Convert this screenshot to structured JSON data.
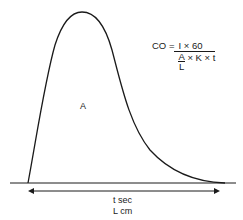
{
  "diagram": {
    "curve_label": "A",
    "formula": {
      "lhs": "CO",
      "equals": "=",
      "numerator": "I × 60",
      "denominator": {
        "area_fraction": {
          "top": "A",
          "bottom": "L"
        },
        "rest": "× K × t"
      }
    },
    "axis_labels": {
      "time": "t sec",
      "length": "L cm"
    },
    "colors": {
      "line": "#1a1a1a",
      "background": "#ffffff"
    }
  }
}
